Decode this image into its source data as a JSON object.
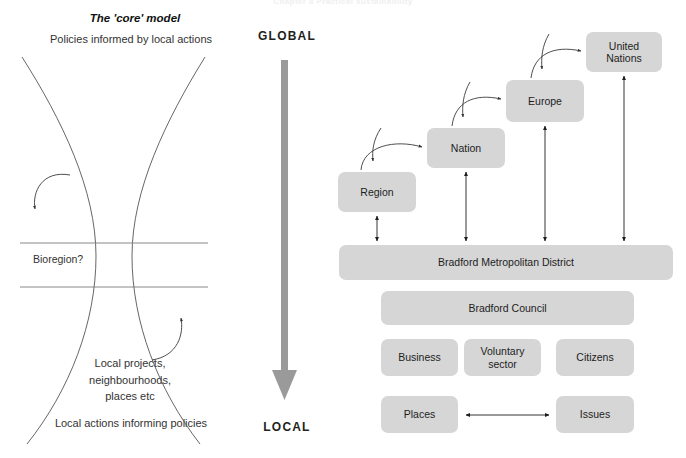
{
  "running_head": "Chapter 8 Practical sustainability",
  "left_panel": {
    "title": "The 'core' model",
    "caption_top": "Policies informed by local actions",
    "caption_bottom": "Local actions informing policies",
    "bioregion_label": "Bioregion?",
    "local_stack": "Local projects,\nneighbourhoods,\nplaces etc",
    "local_stack_lines": [
      "Local projects,",
      "neighbourhoods,",
      "places etc"
    ]
  },
  "axis": {
    "top_label": "GLOBAL",
    "bottom_label": "LOCAL",
    "arrow_direction": "down",
    "arrow_color": "#8c8c8c"
  },
  "right_panel": {
    "node_fill": "#d6d6d6",
    "nodes": [
      {
        "id": "region",
        "label": "Region"
      },
      {
        "id": "nation",
        "label": "Nation"
      },
      {
        "id": "europe",
        "label": "Europe"
      },
      {
        "id": "united-nations",
        "label": "United Nations"
      },
      {
        "id": "bradford-metropolitan-district",
        "label": "Bradford Metropolitan District"
      },
      {
        "id": "bradford-council",
        "label": "Bradford Council"
      },
      {
        "id": "business",
        "label": "Business"
      },
      {
        "id": "voluntary-sector",
        "label": "Voluntary sector"
      },
      {
        "id": "voluntary-sector-line1",
        "label": "Voluntary"
      },
      {
        "id": "voluntary-sector-line2",
        "label": "sector"
      },
      {
        "id": "citizens",
        "label": "Citizens"
      },
      {
        "id": "places",
        "label": "Places"
      },
      {
        "id": "issues",
        "label": "Issues"
      }
    ],
    "connections": [
      {
        "from": "region",
        "to": "nation",
        "style": "curved",
        "heads": "both-ends-separate"
      },
      {
        "from": "nation",
        "to": "europe",
        "style": "curved",
        "heads": "both-ends-separate"
      },
      {
        "from": "europe",
        "to": "united-nations",
        "style": "curved",
        "heads": "both-ends-separate"
      },
      {
        "from": "region",
        "to": "bradford-metropolitan-district",
        "style": "straight",
        "heads": "double"
      },
      {
        "from": "nation",
        "to": "bradford-metropolitan-district",
        "style": "straight",
        "heads": "double"
      },
      {
        "from": "europe",
        "to": "bradford-metropolitan-district",
        "style": "straight",
        "heads": "double"
      },
      {
        "from": "united-nations",
        "to": "bradford-metropolitan-district",
        "style": "straight",
        "heads": "double"
      },
      {
        "from": "places",
        "to": "issues",
        "style": "straight-horizontal",
        "heads": "double"
      }
    ]
  }
}
